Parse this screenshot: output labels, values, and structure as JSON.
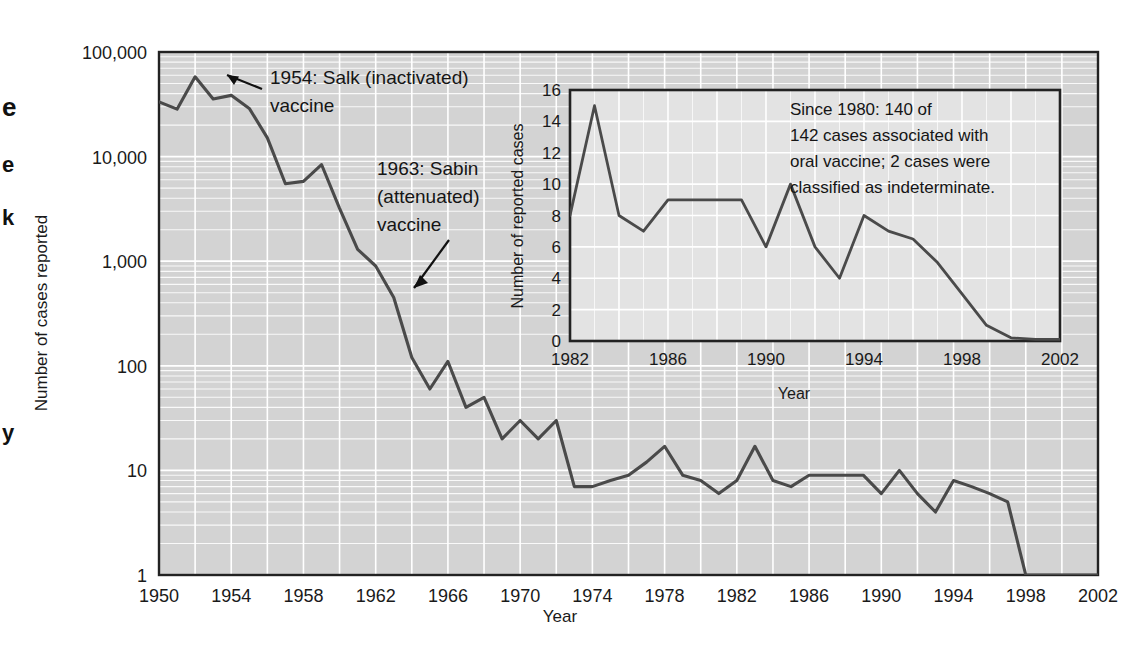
{
  "figure": {
    "background_color": "#ffffff",
    "plot_background_color": "#d3d3d3",
    "gridline_color": "#ffffff",
    "line_color": "#4a4a4a",
    "frame_color": "#222222"
  },
  "main_axis": {
    "ylabel": "Number of cases reported",
    "xlabel": "Year",
    "ytick_labels": [
      "100,000",
      "10,000",
      "1,000",
      "100",
      "10",
      "1"
    ],
    "ytick_values": [
      100000,
      10000,
      1000,
      100,
      10,
      1
    ],
    "xtick_labels": [
      "1950",
      "1954",
      "1958",
      "1962",
      "1966",
      "1970",
      "1974",
      "1978",
      "1982",
      "1986",
      "1990",
      "1994",
      "1998",
      "2002"
    ],
    "xtick_values": [
      1950,
      1954,
      1958,
      1962,
      1966,
      1970,
      1974,
      1978,
      1982,
      1986,
      1990,
      1994,
      1998,
      2002
    ]
  },
  "annotations": [
    {
      "name": "salk-annotation",
      "line1": "1954: Salk (inactivated)",
      "line2": "vaccine"
    },
    {
      "name": "sabin-annotation",
      "line1": "1963: Sabin",
      "line2": "(attenuated)",
      "line3": "vaccine"
    }
  ],
  "inset": {
    "ylabel": "Number of reported cases",
    "xlabel": "Year",
    "ytick_labels": [
      "0",
      "2",
      "4",
      "6",
      "8",
      "10",
      "12",
      "14",
      "16"
    ],
    "ytick_values": [
      0,
      2,
      4,
      6,
      8,
      10,
      12,
      14,
      16
    ],
    "xtick_labels": [
      "1982",
      "1986",
      "1990",
      "1994",
      "1998",
      "2002"
    ],
    "xtick_values": [
      1982,
      1986,
      1990,
      1994,
      1998,
      2002
    ],
    "note": {
      "line1": "Since 1980: 140 of",
      "line2": "142 cases associated with",
      "line3": "oral vaccine; 2 cases were",
      "line4": "classified as indeterminate."
    }
  },
  "edge_fragments": [
    {
      "text": "e",
      "top": 92
    },
    {
      "text": "e",
      "top": 152
    },
    {
      "text": "k",
      "top": 205
    },
    {
      "text": "y",
      "top": 420
    }
  ],
  "chart_data": [
    {
      "type": "line",
      "name": "main-polio-cases",
      "title": "",
      "xlabel": "Year",
      "ylabel": "Number of cases reported",
      "yscale": "log",
      "ylim": [
        1,
        100000
      ],
      "xlim": [
        1950,
        2002
      ],
      "grid": true,
      "legend": "none",
      "x": [
        1950,
        1951,
        1952,
        1953,
        1954,
        1955,
        1956,
        1957,
        1958,
        1959,
        1960,
        1961,
        1962,
        1963,
        1964,
        1965,
        1966,
        1967,
        1968,
        1969,
        1970,
        1971,
        1972,
        1973,
        1974,
        1975,
        1976,
        1977,
        1978,
        1979,
        1980,
        1981,
        1982,
        1983,
        1984,
        1985,
        1986,
        1987,
        1988,
        1989,
        1990,
        1991,
        1992,
        1993,
        1994,
        1995,
        1996,
        1997,
        1998,
        1999,
        2000,
        2001,
        2002
      ],
      "values": [
        33300,
        28400,
        57900,
        35600,
        38500,
        28900,
        15100,
        5500,
        5800,
        8400,
        3200,
        1300,
        900,
        450,
        120,
        60,
        110,
        40,
        50,
        20,
        30,
        20,
        30,
        7,
        7,
        8,
        9,
        12,
        17,
        9,
        8,
        6,
        8,
        17,
        8,
        7,
        9,
        9,
        9,
        9,
        6,
        10,
        6,
        4,
        8,
        7,
        6,
        5,
        1,
        1,
        1,
        1,
        1
      ]
    },
    {
      "type": "line",
      "name": "inset-vaccine-associated-cases",
      "title": "",
      "xlabel": "Year",
      "ylabel": "Number of reported cases",
      "yscale": "linear",
      "ylim": [
        0,
        16
      ],
      "xlim": [
        1982,
        2002
      ],
      "grid": true,
      "legend": "none",
      "x": [
        1982,
        1983,
        1984,
        1985,
        1986,
        1987,
        1988,
        1989,
        1990,
        1991,
        1992,
        1993,
        1994,
        1995,
        1996,
        1997,
        1998,
        1999,
        2000,
        2001,
        2002
      ],
      "values": [
        8,
        15,
        8,
        7,
        9,
        9,
        9,
        9,
        6,
        10,
        6,
        4,
        8,
        7,
        6.5,
        5,
        3,
        1,
        0.2,
        0.1,
        0.1
      ]
    }
  ]
}
